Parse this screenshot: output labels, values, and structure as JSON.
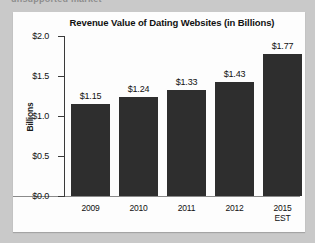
{
  "page": {
    "clipped_header_text": "unsupported market"
  },
  "chart_data": {
    "type": "bar",
    "title": "Revenue Value of Dating Websites (in Billions)",
    "xlabel": "",
    "ylabel": "Billions",
    "categories": [
      "2009",
      "2010",
      "2011",
      "2012",
      "2015\nEST"
    ],
    "values": [
      1.15,
      1.24,
      1.33,
      1.43,
      1.77
    ],
    "data_labels": [
      "$1.15",
      "$1.24",
      "$1.33",
      "$1.43",
      "$1.77"
    ],
    "ylim": [
      0.0,
      2.0
    ],
    "ytick_values": [
      0.0,
      0.5,
      1.0,
      1.5,
      2.0
    ],
    "ytick_labels": [
      "$0.0",
      "$0.5",
      "$1.0",
      "$1.5",
      "$2.0"
    ],
    "grid": false,
    "legend": false,
    "bar_color": "#2e2e2e",
    "panel_color": "#fdfdfd",
    "background_color": "#c9c9c9"
  }
}
